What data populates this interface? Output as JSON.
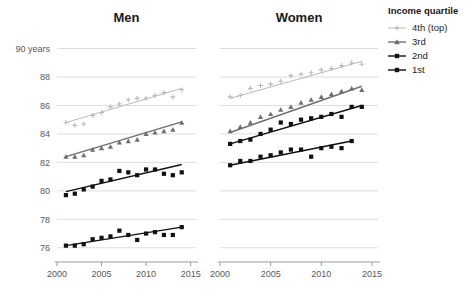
{
  "legend": {
    "title": "Income quartile",
    "items": [
      {
        "label": "4th (top)",
        "color": "#b9b9b9",
        "marker": "plus"
      },
      {
        "label": "3rd",
        "color": "#6f6f6f",
        "marker": "triangle"
      },
      {
        "label": "2nd",
        "color": "#111111",
        "marker": "square"
      },
      {
        "label": "1st",
        "color": "#111111",
        "marker": "square"
      }
    ]
  },
  "chart_data": {
    "type": "scatter",
    "title": "",
    "xlabel": "",
    "ylabel": "90 years",
    "xlim": [
      2000,
      2015.6
    ],
    "ylim": [
      75.0,
      90.6
    ],
    "xticks": [
      2000,
      2005,
      2010,
      2015
    ],
    "xticklabels": [
      "2000",
      "2005",
      "2010",
      "2015"
    ],
    "yticks": [
      76,
      78,
      80,
      82,
      84,
      86,
      88,
      90
    ],
    "yticklabels": [
      "76",
      "78",
      "80",
      "82",
      "84",
      "86",
      "88",
      "90 years"
    ],
    "grid": true,
    "legend_position": "right",
    "panels": [
      {
        "name": "men",
        "title": "Men",
        "series": [
          {
            "name": "4th (top)",
            "marker": "plus",
            "color": "#b9b9b9",
            "x": [
              2001,
              2002,
              2003,
              2004,
              2005,
              2006,
              2007,
              2008,
              2009,
              2010,
              2011,
              2012,
              2013,
              2014
            ],
            "y": [
              84.8,
              84.6,
              84.7,
              85.3,
              85.5,
              85.9,
              86.1,
              86.4,
              86.5,
              86.5,
              86.7,
              86.9,
              86.6,
              87.1
            ],
            "fit": {
              "x": [
                2001,
                2014
              ],
              "y": [
                84.8,
                87.2
              ]
            }
          },
          {
            "name": "3rd",
            "marker": "triangle",
            "color": "#6f6f6f",
            "x": [
              2001,
              2002,
              2003,
              2004,
              2005,
              2006,
              2007,
              2008,
              2009,
              2010,
              2011,
              2012,
              2013,
              2014
            ],
            "y": [
              82.4,
              82.4,
              82.5,
              82.9,
              83.0,
              83.1,
              83.4,
              83.5,
              83.6,
              84.0,
              84.1,
              84.2,
              84.3,
              84.8
            ],
            "fit": {
              "x": [
                2001,
                2014
              ],
              "y": [
                82.4,
                84.85
              ]
            }
          },
          {
            "name": "2nd",
            "marker": "square",
            "color": "#111111",
            "x": [
              2001,
              2002,
              2003,
              2004,
              2005,
              2006,
              2007,
              2008,
              2009,
              2010,
              2011,
              2012,
              2013,
              2014
            ],
            "y": [
              79.7,
              79.8,
              80.1,
              80.3,
              80.7,
              80.8,
              81.4,
              81.3,
              81.1,
              81.5,
              81.5,
              81.2,
              81.1,
              81.3
            ],
            "fit": {
              "x": [
                2001,
                2014
              ],
              "y": [
                79.95,
                81.85
              ]
            }
          },
          {
            "name": "1st",
            "marker": "square",
            "color": "#111111",
            "x": [
              2001,
              2002,
              2003,
              2004,
              2005,
              2006,
              2007,
              2008,
              2009,
              2010,
              2011,
              2012,
              2013,
              2014
            ],
            "y": [
              76.15,
              76.15,
              76.25,
              76.6,
              76.7,
              76.8,
              77.2,
              76.9,
              76.55,
              77.0,
              77.1,
              76.9,
              76.9,
              77.45
            ],
            "fit": {
              "x": [
                2001,
                2014
              ],
              "y": [
                76.15,
                77.45
              ]
            }
          }
        ]
      },
      {
        "name": "women",
        "title": "Women",
        "series": [
          {
            "name": "4th (top)",
            "marker": "plus",
            "color": "#b9b9b9",
            "x": [
              2001,
              2002,
              2003,
              2004,
              2005,
              2006,
              2007,
              2008,
              2009,
              2010,
              2011,
              2012,
              2013,
              2014
            ],
            "y": [
              86.6,
              86.7,
              87.2,
              87.4,
              87.5,
              87.7,
              88.1,
              88.2,
              88.3,
              88.5,
              88.6,
              88.8,
              89.0,
              88.9
            ],
            "fit": {
              "x": [
                2001,
                2014
              ],
              "y": [
                86.5,
                89.1
              ]
            }
          },
          {
            "name": "3rd",
            "marker": "triangle",
            "color": "#6f6f6f",
            "x": [
              2001,
              2002,
              2003,
              2004,
              2005,
              2006,
              2007,
              2008,
              2009,
              2010,
              2011,
              2012,
              2013,
              2014
            ],
            "y": [
              84.2,
              84.5,
              84.8,
              85.2,
              85.4,
              85.7,
              85.9,
              86.2,
              86.4,
              86.6,
              86.8,
              87.0,
              87.2,
              87.1
            ],
            "fit": {
              "x": [
                2001,
                2014
              ],
              "y": [
                84.1,
                87.35
              ]
            }
          },
          {
            "name": "2nd",
            "marker": "square",
            "color": "#111111",
            "x": [
              2001,
              2002,
              2003,
              2004,
              2005,
              2006,
              2007,
              2008,
              2009,
              2010,
              2011,
              2012,
              2013,
              2014
            ],
            "y": [
              83.3,
              83.5,
              83.6,
              84.0,
              84.3,
              84.8,
              84.7,
              85.0,
              85.1,
              85.2,
              85.4,
              85.2,
              85.9,
              85.9
            ],
            "fit": {
              "x": [
                2001,
                2014
              ],
              "y": [
                83.3,
                86.0
              ]
            }
          },
          {
            "name": "1st",
            "marker": "square",
            "color": "#111111",
            "x": [
              2001,
              2002,
              2003,
              2004,
              2005,
              2006,
              2007,
              2008,
              2009,
              2010,
              2011,
              2012,
              2013
            ],
            "y": [
              81.8,
              82.1,
              82.1,
              82.4,
              82.5,
              82.7,
              82.9,
              82.9,
              82.4,
              83.0,
              83.1,
              83.0,
              83.5
            ],
            "fit": {
              "x": [
                2001,
                2013
              ],
              "y": [
                81.8,
                83.5
              ]
            }
          }
        ]
      }
    ]
  }
}
